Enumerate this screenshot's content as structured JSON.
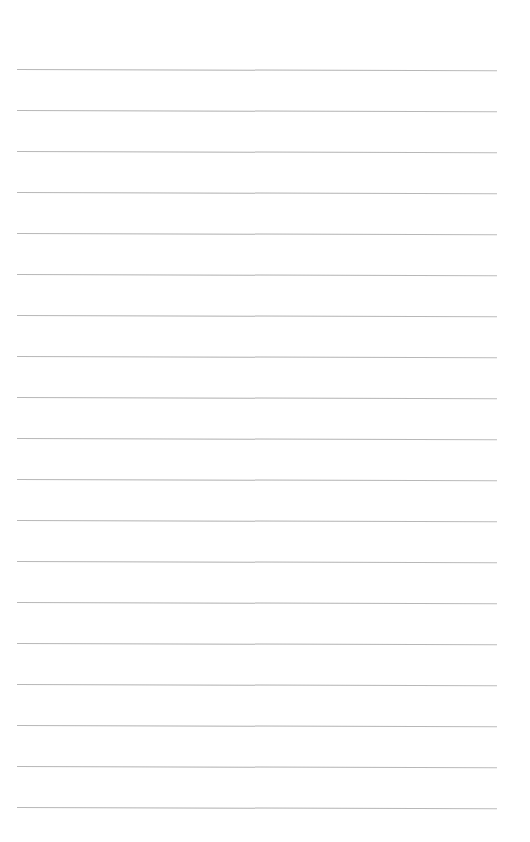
{
  "page": {
    "type": "lined-paper",
    "background_color": "#ffffff",
    "rule_color": "#b4b4b4",
    "rule_count": 19,
    "rule_left": 17,
    "rule_width": 480,
    "rule_spacing": 41,
    "rules": [
      {
        "y": 69
      },
      {
        "y": 110
      },
      {
        "y": 151
      },
      {
        "y": 192
      },
      {
        "y": 233
      },
      {
        "y": 274
      },
      {
        "y": 315
      },
      {
        "y": 356
      },
      {
        "y": 397
      },
      {
        "y": 438
      },
      {
        "y": 479
      },
      {
        "y": 520
      },
      {
        "y": 561
      },
      {
        "y": 602
      },
      {
        "y": 643
      },
      {
        "y": 684
      },
      {
        "y": 725
      },
      {
        "y": 766
      },
      {
        "y": 807
      }
    ]
  }
}
